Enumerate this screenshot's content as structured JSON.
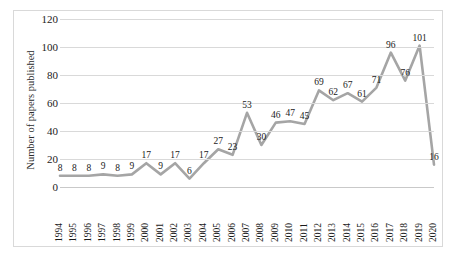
{
  "chart_data": {
    "type": "line",
    "title": "",
    "xlabel": "",
    "ylabel": "Number of papers published",
    "ylim": [
      0,
      120
    ],
    "ytick_step": 20,
    "yticks": [
      0,
      20,
      40,
      60,
      80,
      100,
      120
    ],
    "grid": "horizontal",
    "legend": "none",
    "line_color": "#a5a5a5",
    "data_labels": true,
    "categories": [
      "1994",
      "1995",
      "1996",
      "1997",
      "1998",
      "1999",
      "2000",
      "2001",
      "2002",
      "2003",
      "2004",
      "2005",
      "2006",
      "2007",
      "2008",
      "2009",
      "2010",
      "2011",
      "2012",
      "2013",
      "2014",
      "2015",
      "2016",
      "2017",
      "2018",
      "2019",
      "2020"
    ],
    "values": [
      8,
      8,
      8,
      9,
      8,
      9,
      17,
      9,
      17,
      6,
      17,
      27,
      23,
      53,
      30,
      46,
      47,
      45,
      69,
      62,
      67,
      61,
      71,
      96,
      76,
      101,
      16
    ],
    "series": [
      {
        "name": "Number of papers published",
        "values": [
          8,
          8,
          8,
          9,
          8,
          9,
          17,
          9,
          17,
          6,
          17,
          27,
          23,
          53,
          30,
          46,
          47,
          45,
          69,
          62,
          67,
          61,
          71,
          96,
          76,
          101,
          16
        ]
      }
    ]
  }
}
